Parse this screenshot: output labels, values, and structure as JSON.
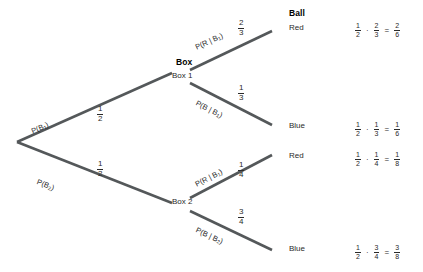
{
  "diagram": {
    "type": "probability-tree",
    "headers": {
      "box": "Box",
      "ball": "Ball"
    },
    "nodes": {
      "box1": "Box 1",
      "box2": "Box 2"
    },
    "leaves": {
      "red1": "Red",
      "blue1": "Blue",
      "red2": "Red",
      "blue2": "Blue"
    },
    "branches": {
      "b1": {
        "expr_p": "P",
        "expr_body": "(B",
        "expr_sub": "1",
        "expr_close": ")",
        "prob_num": "1",
        "prob_den": "2"
      },
      "b2": {
        "expr_p": "P",
        "expr_body": "(B",
        "expr_sub": "2",
        "expr_close": ")",
        "prob_num": "1",
        "prob_den": "2"
      },
      "r_given_b1": {
        "prefix": "P(R | B",
        "sub": "1",
        "suffix": ")",
        "prob_num": "2",
        "prob_den": "3"
      },
      "b_given_b1": {
        "prefix": "P(B | B",
        "sub": "1",
        "suffix": ")",
        "prob_num": "1",
        "prob_den": "3"
      },
      "r_given_b2": {
        "prefix": "P(R | B",
        "sub": "1",
        "suffix": ")",
        "prob_num": "1",
        "prob_den": "4"
      },
      "b_given_b2": {
        "prefix": "P(B | B",
        "sub": "2",
        "suffix": ")",
        "prob_num": "3",
        "prob_den": "4"
      }
    },
    "equations": [
      {
        "id": "red1",
        "a_num": "1",
        "a_den": "2",
        "op": "·",
        "b_num": "2",
        "b_den": "3",
        "eq": "=",
        "r_num": "2",
        "r_den": "6"
      },
      {
        "id": "blue1",
        "a_num": "1",
        "a_den": "2",
        "op": "·",
        "b_num": "1",
        "b_den": "3",
        "eq": "=",
        "r_num": "1",
        "r_den": "6"
      },
      {
        "id": "red2",
        "a_num": "1",
        "a_den": "2",
        "op": "·",
        "b_num": "1",
        "b_den": "4",
        "eq": "=",
        "r_num": "1",
        "r_den": "8"
      },
      {
        "id": "blue2",
        "a_num": "1",
        "a_den": "2",
        "op": "·",
        "b_num": "3",
        "b_den": "4",
        "eq": "=",
        "r_num": "3",
        "r_den": "8"
      }
    ],
    "colors": {
      "line": "#54585a",
      "text": "#2a2a2a",
      "heading": "#000000",
      "background": "#ffffff"
    }
  }
}
